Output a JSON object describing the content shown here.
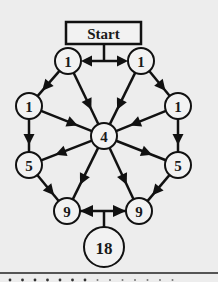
{
  "diagram": {
    "start_label": "Start",
    "nodes": [
      {
        "id": "n1",
        "label": "1",
        "x": 68,
        "y": 61,
        "r": 13
      },
      {
        "id": "n2",
        "label": "1",
        "x": 141,
        "y": 61,
        "r": 13
      },
      {
        "id": "n3",
        "label": "1",
        "x": 29,
        "y": 106,
        "r": 13
      },
      {
        "id": "n4",
        "label": "1",
        "x": 178,
        "y": 106,
        "r": 13
      },
      {
        "id": "n5",
        "label": "4",
        "x": 104,
        "y": 136,
        "r": 13
      },
      {
        "id": "n6",
        "label": "5",
        "x": 29,
        "y": 165,
        "r": 13
      },
      {
        "id": "n7",
        "label": "5",
        "x": 178,
        "y": 165,
        "r": 13
      },
      {
        "id": "n8",
        "label": "9",
        "x": 67,
        "y": 211,
        "r": 13
      },
      {
        "id": "n9",
        "label": "9",
        "x": 139,
        "y": 211,
        "r": 13
      },
      {
        "id": "n10",
        "label": "18",
        "x": 104,
        "y": 247,
        "r": 20
      }
    ],
    "edges": [
      {
        "from": "n1",
        "to": "n3"
      },
      {
        "from": "n1",
        "to": "n5"
      },
      {
        "from": "n2",
        "to": "n4"
      },
      {
        "from": "n2",
        "to": "n5"
      },
      {
        "from": "n3",
        "to": "n5"
      },
      {
        "from": "n4",
        "to": "n5"
      },
      {
        "from": "n3",
        "to": "n6"
      },
      {
        "from": "n4",
        "to": "n7"
      },
      {
        "from": "n5",
        "to": "n6"
      },
      {
        "from": "n5",
        "to": "n7"
      },
      {
        "from": "n5",
        "to": "n8"
      },
      {
        "from": "n5",
        "to": "n9"
      },
      {
        "from": "n6",
        "to": "n8"
      },
      {
        "from": "n7",
        "to": "n9"
      }
    ],
    "colors": {
      "background": "#ededed",
      "stroke": "#111111",
      "node_fill": "#f2f2f2"
    }
  }
}
